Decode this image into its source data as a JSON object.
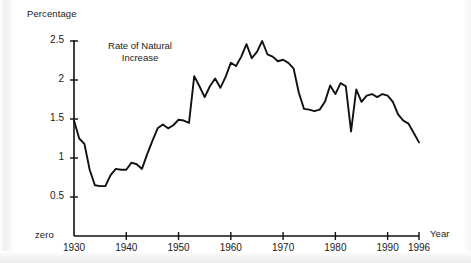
{
  "chart_data": {
    "type": "line",
    "title": "Rate of Natural\nIncrease",
    "title_line1": "Rate of Natural",
    "title_line2": "Increase",
    "xlabel": "Year",
    "ylabel": "Percentage",
    "zero_label": "zero",
    "xlim": [
      1930,
      1996
    ],
    "ylim": [
      0,
      2.5
    ],
    "grid": false,
    "legend": null,
    "series_name": "Rate of Natural Increase",
    "line_color": "#111111",
    "xticks": [
      1930,
      1940,
      1950,
      1960,
      1970,
      1980,
      1990,
      1996
    ],
    "xtick_labels": [
      "1930",
      "1940",
      "1950",
      "1960",
      "1970",
      "1980",
      "1990",
      "1996"
    ],
    "yticks": [
      0.5,
      1,
      1.5,
      2,
      2.5
    ],
    "ytick_labels": [
      "0.5",
      "1",
      "1.5",
      "2",
      "2.5"
    ],
    "x": [
      1930,
      1931,
      1932,
      1933,
      1934,
      1935,
      1936,
      1937,
      1938,
      1939,
      1940,
      1941,
      1942,
      1943,
      1944,
      1945,
      1946,
      1947,
      1948,
      1949,
      1950,
      1951,
      1952,
      1953,
      1954,
      1955,
      1956,
      1957,
      1958,
      1959,
      1960,
      1961,
      1962,
      1963,
      1964,
      1965,
      1966,
      1967,
      1968,
      1969,
      1970,
      1971,
      1972,
      1973,
      1974,
      1975,
      1976,
      1977,
      1978,
      1979,
      1980,
      1981,
      1982,
      1983,
      1984,
      1985,
      1986,
      1987,
      1988,
      1989,
      1990,
      1991,
      1992,
      1993,
      1994,
      1995,
      1996
    ],
    "values": [
      1.48,
      1.25,
      1.18,
      0.85,
      0.65,
      0.64,
      0.64,
      0.78,
      0.86,
      0.85,
      0.85,
      0.94,
      0.92,
      0.86,
      1.05,
      1.22,
      1.38,
      1.43,
      1.38,
      1.42,
      1.49,
      1.48,
      1.45,
      2.05,
      1.92,
      1.78,
      1.92,
      2.02,
      1.9,
      2.04,
      2.22,
      2.18,
      2.3,
      2.46,
      2.28,
      2.36,
      2.5,
      2.33,
      2.3,
      2.24,
      2.26,
      2.22,
      2.15,
      1.84,
      1.63,
      1.62,
      1.6,
      1.62,
      1.72,
      1.93,
      1.82,
      1.96,
      1.92,
      1.34,
      1.88,
      1.72,
      1.8,
      1.82,
      1.78,
      1.82,
      1.8,
      1.72,
      1.56,
      1.48,
      1.44,
      1.32,
      1.2
    ]
  }
}
